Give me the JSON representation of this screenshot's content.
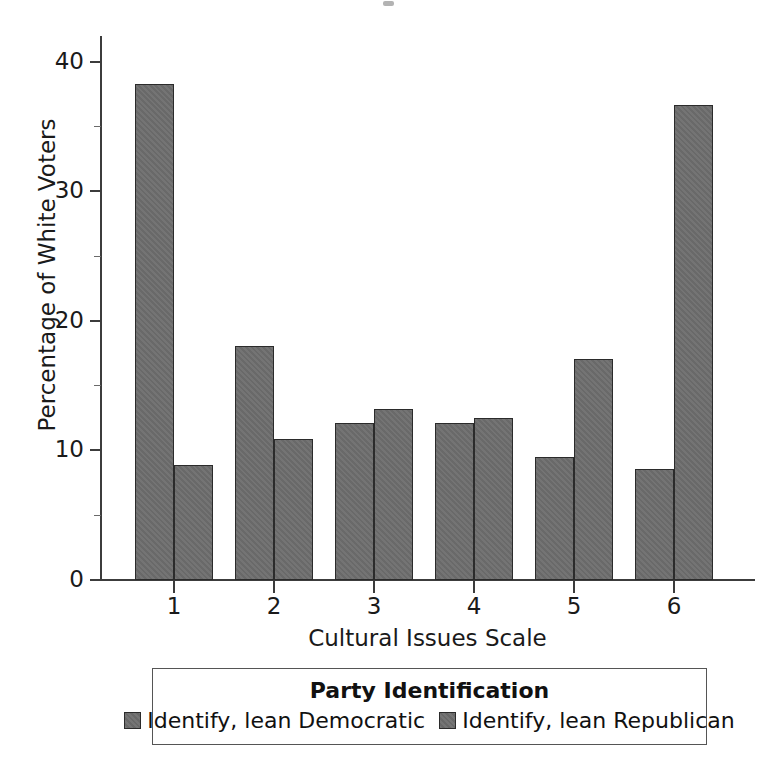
{
  "chart_data": {
    "type": "bar",
    "title": "",
    "xlabel": "Cultural Issues Scale",
    "ylabel": "Percentage of White Voters",
    "categories": [
      "1",
      "2",
      "3",
      "4",
      "5",
      "6"
    ],
    "ylim": [
      0,
      42
    ],
    "yticks": [
      0,
      10,
      20,
      30,
      40
    ],
    "ytick_labels": [
      "0",
      "10",
      "20",
      "30",
      "40"
    ],
    "yminor_ticks": [
      5,
      15,
      25,
      35
    ],
    "grid": false,
    "legend_position": "below",
    "legend_title": "Party Identification",
    "series": [
      {
        "name": "Identify, lean Democratic",
        "color": "#6e6e6e",
        "values": [
          38.3,
          18.1,
          12.1,
          12.1,
          9.5,
          8.6
        ]
      },
      {
        "name": "Identify, lean Republican",
        "color": "#6e6e6e",
        "values": [
          8.9,
          10.9,
          13.2,
          12.5,
          17.1,
          36.7
        ]
      }
    ]
  },
  "axes": {
    "ylabel": "Percentage of White Voters",
    "xlabel": "Cultural Issues Scale"
  },
  "legend": {
    "title": "Party Identification",
    "items": [
      {
        "label": "Identify, lean Democratic"
      },
      {
        "label": "Identify, lean Republican"
      }
    ]
  }
}
